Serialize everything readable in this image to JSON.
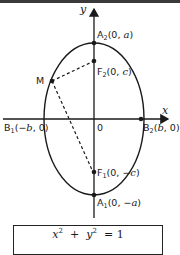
{
  "diagram": {
    "axes": {
      "x_label": "x",
      "y_label": "y",
      "origin_label": "0"
    },
    "points": {
      "A2": {
        "name": "A",
        "sub": "2",
        "coords": "(0, a)",
        "coord_pre": "(0, ",
        "coord_var": "a",
        "coord_post": ")"
      },
      "F2": {
        "name": "F",
        "sub": "2",
        "coords": "(0, c)",
        "coord_pre": "(0, ",
        "coord_var": "c",
        "coord_post": ")"
      },
      "M": {
        "name": "M"
      },
      "B1": {
        "name": "B",
        "sub": "1",
        "coords": "(−b, 0)",
        "coord_pre": "(−",
        "coord_var": "b",
        "coord_post": ", 0)"
      },
      "B2": {
        "name": "B",
        "sub": "2",
        "coords": "(b, 0)",
        "coord_pre": "(",
        "coord_var": "b",
        "coord_post": ", 0)"
      },
      "F1": {
        "name": "F",
        "sub": "1",
        "coords": "(0, −c)",
        "coord_pre": "(0, −",
        "coord_var": "c",
        "coord_post": ")"
      },
      "A1": {
        "name": "A",
        "sub": "1",
        "coords": "(0, −a)",
        "coord_pre": "(0, −",
        "coord_var": "a",
        "coord_post": ")"
      }
    },
    "segments": [
      {
        "from": "M",
        "to": "F2",
        "style": "dashed"
      },
      {
        "from": "M",
        "to": "F1",
        "style": "dashed"
      }
    ],
    "formula": {
      "text": "x²/b² + y²/a² = 1",
      "x_var": "x",
      "y_var": "y",
      "exp": "2",
      "plus": "+",
      "equals": "= 1"
    },
    "colors": {
      "stroke": "#1a1a1a",
      "topbar": "#3a3a3a",
      "background": "#ffffff"
    }
  }
}
